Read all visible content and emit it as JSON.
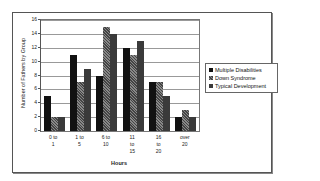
{
  "chart_data": {
    "type": "bar",
    "title": "",
    "xlabel": "Hours",
    "ylabel": "Number of Fathers by Group",
    "ylim": [
      0,
      16
    ],
    "yticks": [
      0,
      2,
      4,
      6,
      8,
      10,
      12,
      14,
      16
    ],
    "grid": true,
    "legend_position": "right",
    "categories": [
      "0 to 1",
      "1 to 5",
      "6 to 10",
      "11 to 15",
      "16 to 20",
      "over 20"
    ],
    "category_labels": [
      "0  to\n1",
      "1  to\n5",
      "6  to\n10",
      "11\nto\n15",
      "16\nto\n20",
      "over\n20"
    ],
    "series": [
      {
        "name": "Multiple Disabilities",
        "values": [
          5,
          11,
          8,
          12,
          7,
          2
        ]
      },
      {
        "name": "Down Syndrome",
        "values": [
          2,
          7,
          15,
          11,
          7,
          3
        ]
      },
      {
        "name": "Typical Development",
        "values": [
          2,
          9,
          14,
          13,
          5,
          2
        ]
      }
    ]
  },
  "legend": {
    "items": [
      "Multiple Disabilities",
      "Down Syndrome",
      "Typical Development"
    ]
  },
  "axis": {
    "x_title": "Hours",
    "y_title": "Number of Fathers by Group"
  }
}
